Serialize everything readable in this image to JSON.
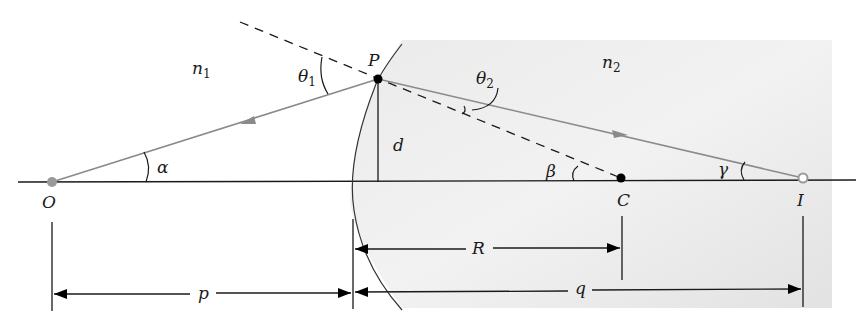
{
  "diagram": {
    "type": "refraction-at-spherical-surface",
    "media": {
      "left": {
        "label": "n",
        "subscript": "1"
      },
      "right": {
        "label": "n",
        "subscript": "2"
      }
    },
    "points": {
      "object": {
        "label": "O"
      },
      "incidence": {
        "label": "P"
      },
      "center": {
        "label": "C"
      },
      "image": {
        "label": "I"
      }
    },
    "angles": {
      "alpha": "α",
      "beta": "β",
      "gamma": "γ",
      "theta1": {
        "label": "θ",
        "subscript": "1"
      },
      "theta2": {
        "label": "θ",
        "subscript": "2"
      }
    },
    "lengths": {
      "height": "d",
      "radius": "R",
      "object_distance": "p",
      "image_distance": "q"
    },
    "colors": {
      "ray": "#8a8a8a",
      "line": "#1a1a1a",
      "medium2_fill": "#e4e4e4",
      "object_dot": "#9a9a9a"
    }
  }
}
